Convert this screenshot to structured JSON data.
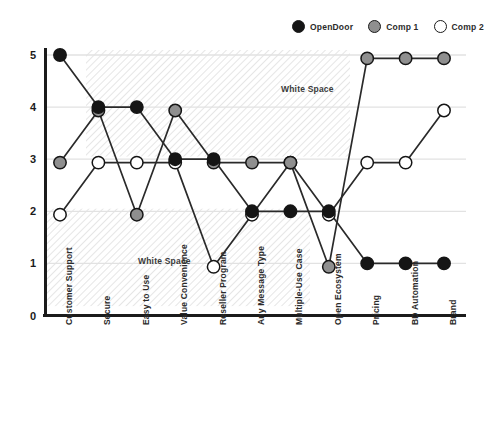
{
  "chart_data": {
    "type": "line",
    "title": "",
    "xlabel": "",
    "ylabel": "",
    "ylim": [
      0,
      5
    ],
    "yticks": [
      "0",
      "1",
      "2",
      "3",
      "4",
      "5"
    ],
    "grid": true,
    "legend_position": "top-right",
    "categories": [
      "Customer Support",
      "Secure",
      "Easy to Use",
      "Value Convenience",
      "Reseller Program",
      "Any Message Type",
      "Multiple-Use Case",
      "Open Ecosystem",
      "Pricing",
      "BD Automation",
      "Brand"
    ],
    "series": [
      {
        "name": "OpenDoor",
        "color": "#151515",
        "values": [
          5,
          4,
          4,
          3,
          3,
          2,
          2,
          2,
          1,
          1,
          1
        ]
      },
      {
        "name": "Comp 1",
        "color": "#8f8f8f",
        "values": [
          3,
          4,
          2,
          4,
          3,
          3,
          3,
          1,
          5,
          5,
          5
        ]
      },
      {
        "name": "Comp 2",
        "color": "#ffffff",
        "values": [
          2,
          3,
          3,
          3,
          1,
          2,
          3,
          2,
          3,
          3,
          4
        ]
      }
    ],
    "annotations": [
      {
        "text": "White Space",
        "x": 0.56,
        "y": 4.35
      },
      {
        "text": "White Space",
        "x": 0.22,
        "y": 1.05
      }
    ]
  },
  "legend": {
    "items": [
      {
        "label": "OpenDoor",
        "color": "#151515"
      },
      {
        "label": "Comp 1",
        "color": "#8f8f8f"
      },
      {
        "label": "Comp 2",
        "color": "#ffffff"
      }
    ]
  },
  "colors": {
    "axis": "#1b1b1b",
    "grid": "#e2e2e2",
    "line": "#2a2a2a",
    "hatch": "#bdbdbd",
    "text": "#2b2b2b"
  }
}
